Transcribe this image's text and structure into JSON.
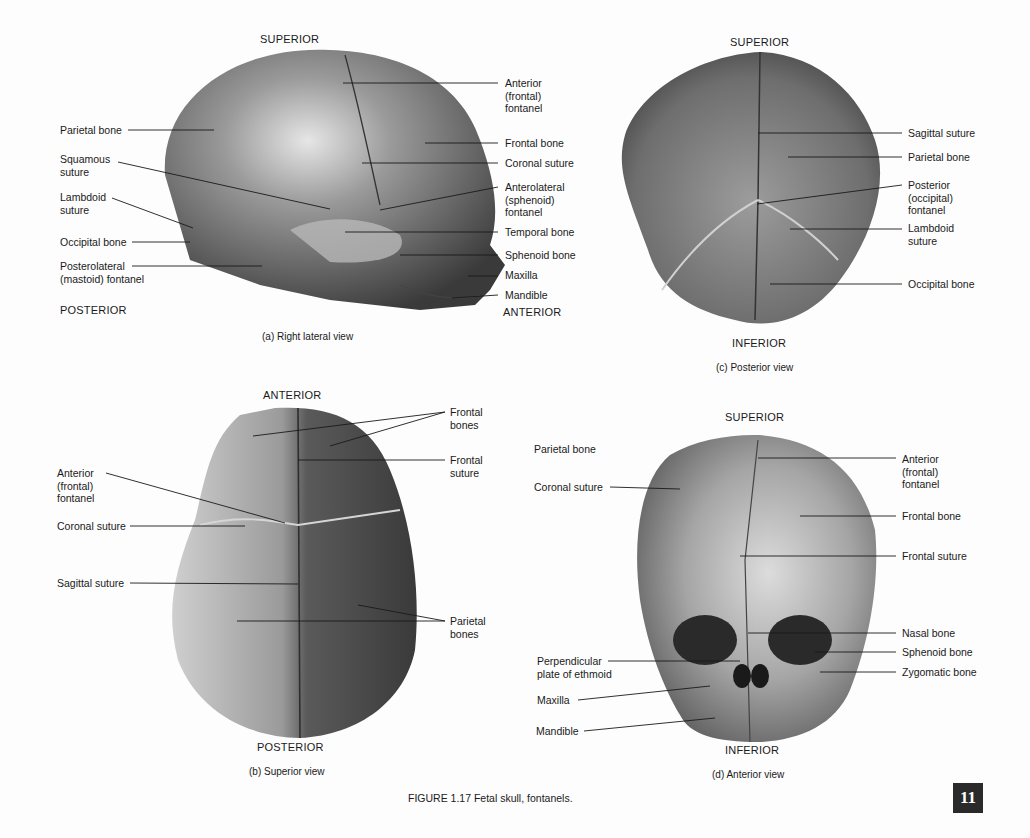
{
  "figure": {
    "title": "FIGURE 1.17  Fetal skull, fontanels.",
    "page_number": "11"
  },
  "panels": {
    "a": {
      "caption": "(a) Right lateral view",
      "directions": {
        "top": "SUPERIOR",
        "left": "POSTERIOR",
        "right": "ANTERIOR"
      },
      "left_labels": [
        "Parietal bone",
        "Squamous suture",
        "Lambdoid suture",
        "Occipital bone",
        "Posterolateral (mastoid) fontanel"
      ],
      "right_labels": [
        "Anterior (frontal) fontanel",
        "Frontal bone",
        "Coronal suture",
        "Anterolateral (sphenoid) fontanel",
        "Temporal bone",
        "Sphenoid bone",
        "Maxilla",
        "Mandible"
      ]
    },
    "b": {
      "caption": "(b) Superior view",
      "directions": {
        "top": "ANTERIOR",
        "bottom": "POSTERIOR"
      },
      "left_labels": [
        "Anterior (frontal) fontanel",
        "Coronal suture",
        "Sagittal suture"
      ],
      "right_labels": [
        "Frontal bones",
        "Frontal suture",
        "Parietal bones"
      ]
    },
    "c": {
      "caption": "(c) Posterior view",
      "directions": {
        "top": "SUPERIOR",
        "bottom": "INFERIOR"
      },
      "right_labels": [
        "Sagittal suture",
        "Parietal bone",
        "Posterior (occipital) fontanel",
        "Lambdoid suture",
        "Occipital bone"
      ]
    },
    "d": {
      "caption": "(d) Anterior view",
      "directions": {
        "top": "SUPERIOR",
        "bottom": "INFERIOR"
      },
      "left_labels": [
        "Parietal bone",
        "Coronal suture",
        "Perpendicular plate of ethmoid",
        "Maxilla",
        "Mandible"
      ],
      "right_labels": [
        "Anterior (frontal) fontanel",
        "Frontal bone",
        "Frontal suture",
        "Nasal bone",
        "Sphenoid bone",
        "Zygomatic bone"
      ]
    }
  },
  "colors": {
    "bone_dark": "#3a3a3a",
    "bone_mid": "#8a8a8a",
    "bone_light": "#d8d8d8",
    "page_box": "#2a2a2a"
  }
}
